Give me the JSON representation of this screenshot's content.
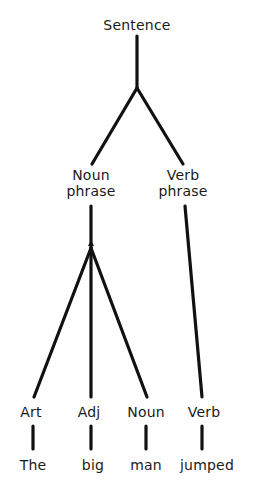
{
  "diagram": {
    "type": "syntax-tree",
    "root": {
      "label": "Sentence",
      "children": [
        {
          "label_line1": "Noun",
          "label_line2": "phrase",
          "children": [
            {
              "label": "Art",
              "word": "The"
            },
            {
              "label": "Adj",
              "word": "big"
            },
            {
              "label": "Noun",
              "word": "man"
            }
          ]
        },
        {
          "label_line1": "Verb",
          "label_line2": "phrase",
          "children": [
            {
              "label": "Verb",
              "word": "jumped"
            }
          ]
        }
      ]
    },
    "line_color": "#111111",
    "text_color": "#1a1a1a"
  }
}
